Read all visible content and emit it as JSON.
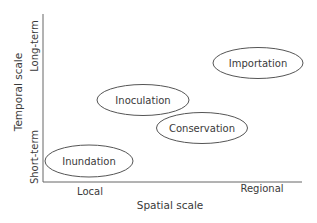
{
  "diagram": {
    "type": "2d-scale-plot",
    "x_axis": {
      "title": "Spatial scale",
      "low_label": "Local",
      "high_label": "Regional"
    },
    "y_axis": {
      "title": "Temporal scale",
      "low_label": "Short-term",
      "high_label": "Long-term"
    },
    "items": [
      {
        "label": "Inundation",
        "spatial": "local",
        "temporal": "short-term"
      },
      {
        "label": "Inoculation",
        "spatial": "local-to-mid",
        "temporal": "mid"
      },
      {
        "label": "Conservation",
        "spatial": "mid-to-regional",
        "temporal": "mid-short"
      },
      {
        "label": "Importation",
        "spatial": "regional",
        "temporal": "long-term"
      }
    ],
    "colors": {
      "stroke": "#555555",
      "text": "#3a3a3a",
      "background": "#ffffff"
    }
  }
}
